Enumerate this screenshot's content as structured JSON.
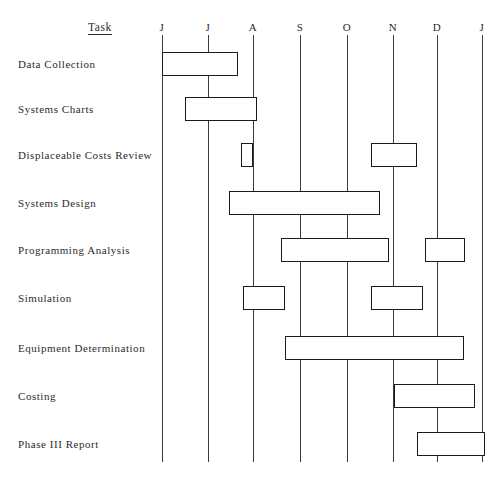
{
  "chart_data": {
    "type": "bar",
    "chart_kind": "gantt",
    "title": "",
    "xlabel": "",
    "ylabel": "Task",
    "grid": true,
    "legend_position": "none",
    "axis_header": "Task",
    "categories": [
      "Data Collection",
      "Systems Charts",
      "Displaceable Costs Review",
      "Systems Design",
      "Programming Analysis",
      "Simulation",
      "Equipment Determination",
      "Costing",
      "Phase III Report"
    ],
    "x_tick_labels": [
      "J",
      "J",
      "A",
      "S",
      "O",
      "N",
      "D",
      "J"
    ],
    "x_tick_months": [
      "June",
      "July",
      "August",
      "September",
      "October",
      "November",
      "December",
      "January"
    ],
    "x_tick_positions": [
      162,
      208,
      253,
      300,
      347,
      393,
      437,
      482
    ],
    "xlim": [
      162,
      482
    ],
    "rows": [
      {
        "label": "Data Collection",
        "y_center": 64,
        "bars": [
          {
            "start": 162,
            "end": 238,
            "start_month": "J",
            "end_month": "A"
          }
        ]
      },
      {
        "label": "Systems Charts",
        "y_center": 109,
        "bars": [
          {
            "start": 185,
            "end": 257,
            "start_month": "J",
            "end_month": "A"
          }
        ]
      },
      {
        "label": "Displaceable Costs Review",
        "y_center": 155,
        "bars": [
          {
            "start": 241,
            "end": 253,
            "start_month": "A",
            "end_month": "A"
          },
          {
            "start": 371,
            "end": 417,
            "start_month": "N",
            "end_month": "D"
          }
        ]
      },
      {
        "label": "Systems Design",
        "y_center": 203,
        "bars": [
          {
            "start": 229,
            "end": 380,
            "start_month": "A",
            "end_month": "N"
          }
        ]
      },
      {
        "label": "Programming Analysis",
        "y_center": 250,
        "bars": [
          {
            "start": 281,
            "end": 389,
            "start_month": "S",
            "end_month": "N"
          },
          {
            "start": 425,
            "end": 465,
            "start_month": "D",
            "end_month": "D"
          }
        ]
      },
      {
        "label": "Simulation",
        "y_center": 298,
        "bars": [
          {
            "start": 243,
            "end": 285,
            "start_month": "A",
            "end_month": "S"
          },
          {
            "start": 371,
            "end": 423,
            "start_month": "N",
            "end_month": "D"
          }
        ]
      },
      {
        "label": "Equipment Determination",
        "y_center": 348,
        "bars": [
          {
            "start": 285,
            "end": 464,
            "start_month": "S",
            "end_month": "D"
          }
        ]
      },
      {
        "label": "Costing",
        "y_center": 396,
        "bars": [
          {
            "start": 394,
            "end": 475,
            "start_month": "N",
            "end_month": "J"
          }
        ]
      },
      {
        "label": "Phase III Report",
        "y_center": 444,
        "bars": [
          {
            "start": 417,
            "end": 485,
            "start_month": "D",
            "end_month": "J"
          }
        ]
      }
    ],
    "colors": {
      "bar_fill": "#ffffff",
      "bar_stroke": "#1a1a1a",
      "grid_line": "#3a3a3a",
      "text": "#2b2b2b",
      "background": "#ffffff"
    },
    "geometry": {
      "grid_top": 35,
      "grid_bottom": 462,
      "bar_height": 24,
      "label_x": 18,
      "month_label_y": 21,
      "task_header_x": 88,
      "task_header_y": 21
    }
  }
}
